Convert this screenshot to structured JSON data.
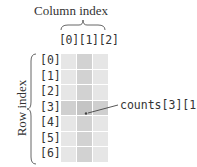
{
  "column_axis": {
    "title": "Column index",
    "labels": [
      "[0]",
      "[1]",
      "[2]"
    ],
    "labels_text": "[0][1][2]"
  },
  "row_axis": {
    "title": "Row index",
    "labels": [
      "[0]",
      "[1]",
      "[2]",
      "[3]",
      "[4]",
      "[5]",
      "[6]"
    ]
  },
  "grid": {
    "rows": 7,
    "cols": 3,
    "highlight_row": 3,
    "highlight_col": 1,
    "colors": {
      "base": "#e6e6e6",
      "highlight_col": "#d2d2d2",
      "highlight_row": "#cfcfcf",
      "target": "#c4c4c4"
    }
  },
  "annotation": {
    "label": "counts[3][1]",
    "target_row": 3,
    "target_col": 1
  }
}
